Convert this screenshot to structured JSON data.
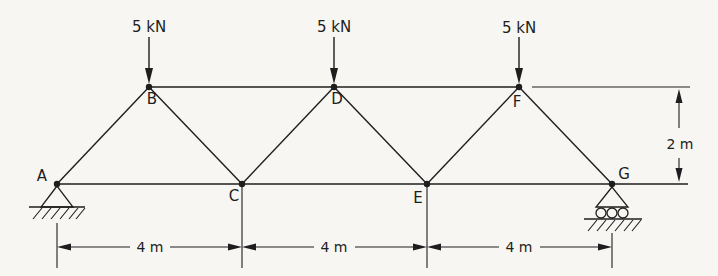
{
  "figure": {
    "background_color": "#f7f6f2",
    "line_color": "#1e1e1e",
    "loads": [
      {
        "at_joint": "B",
        "label": "5 kN"
      },
      {
        "at_joint": "D",
        "label": "5 kN"
      },
      {
        "at_joint": "F",
        "label": "5 kN"
      }
    ],
    "joints": [
      {
        "label": "A"
      },
      {
        "label": "B"
      },
      {
        "label": "C"
      },
      {
        "label": "D"
      },
      {
        "label": "E"
      },
      {
        "label": "F"
      },
      {
        "label": "G"
      }
    ],
    "supports": [
      {
        "at_joint": "A",
        "type": "pin-support"
      },
      {
        "at_joint": "G",
        "type": "roller-support"
      }
    ],
    "dimensions": {
      "bottom_spans": [
        "4 m",
        "4 m",
        "4 m"
      ],
      "right_height": "2 m"
    }
  }
}
